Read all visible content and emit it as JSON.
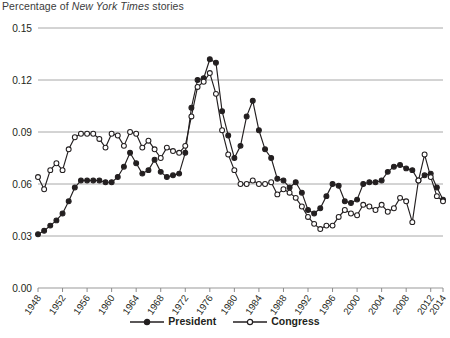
{
  "chart_data": {
    "type": "line",
    "title": "Percentage of New York Times stories",
    "title_parts": {
      "pre": "Percentage of ",
      "italic": "New York Times",
      "post": " stories"
    },
    "xlabel": "",
    "ylabel": "",
    "ylim": [
      0.0,
      0.15
    ],
    "xlim": [
      1948,
      2014
    ],
    "yticks": [
      "0.00",
      "0.03",
      "0.06",
      "0.09",
      "0.12",
      "0.15"
    ],
    "ytick_values": [
      0.0,
      0.03,
      0.06,
      0.09,
      0.12,
      0.15
    ],
    "xticks": [
      "1948",
      "1952",
      "1956",
      "1960",
      "1964",
      "1968",
      "1972",
      "1976",
      "1980",
      "1984",
      "1988",
      "1992",
      "1996",
      "2000",
      "2004",
      "2008",
      "2012",
      "2014"
    ],
    "xtick_values": [
      1948,
      1952,
      1956,
      1960,
      1964,
      1968,
      1972,
      1976,
      1980,
      1984,
      1988,
      1992,
      1996,
      2000,
      2004,
      2008,
      2012,
      2014
    ],
    "grid": "horizontal",
    "legend_position": "bottom-center",
    "x": [
      1948,
      1949,
      1950,
      1951,
      1952,
      1953,
      1954,
      1955,
      1956,
      1957,
      1958,
      1959,
      1960,
      1961,
      1962,
      1963,
      1964,
      1965,
      1966,
      1967,
      1968,
      1969,
      1970,
      1971,
      1972,
      1973,
      1974,
      1975,
      1976,
      1977,
      1978,
      1979,
      1980,
      1981,
      1982,
      1983,
      1984,
      1985,
      1986,
      1987,
      1988,
      1989,
      1990,
      1991,
      1992,
      1993,
      1994,
      1995,
      1996,
      1997,
      1998,
      1999,
      2000,
      2001,
      2002,
      2003,
      2004,
      2005,
      2006,
      2007,
      2008,
      2009,
      2010,
      2011,
      2012,
      2013,
      2014
    ],
    "series": [
      {
        "name": "President",
        "marker": "filled-circle",
        "color": "#231f20",
        "values": [
          0.031,
          0.033,
          0.036,
          0.039,
          0.043,
          0.05,
          0.058,
          0.062,
          0.062,
          0.062,
          0.062,
          0.061,
          0.061,
          0.064,
          0.07,
          0.078,
          0.072,
          0.066,
          0.068,
          0.074,
          0.067,
          0.064,
          0.065,
          0.066,
          0.078,
          0.104,
          0.12,
          0.121,
          0.132,
          0.13,
          0.102,
          0.088,
          0.075,
          0.082,
          0.099,
          0.108,
          0.091,
          0.08,
          0.075,
          0.063,
          0.062,
          0.058,
          0.061,
          0.055,
          0.045,
          0.043,
          0.046,
          0.053,
          0.06,
          0.059,
          0.05,
          0.049,
          0.051,
          0.06,
          0.061,
          0.061,
          0.062,
          0.067,
          0.07,
          0.071,
          0.069,
          0.068,
          0.062,
          0.065,
          0.066,
          0.058,
          0.051
        ]
      },
      {
        "name": "Congress",
        "marker": "open-circle",
        "color": "#231f20",
        "values": [
          0.064,
          0.057,
          0.068,
          0.072,
          0.068,
          0.08,
          0.087,
          0.089,
          0.089,
          0.089,
          0.086,
          0.081,
          0.089,
          0.088,
          0.082,
          0.09,
          0.089,
          0.081,
          0.085,
          0.08,
          0.075,
          0.081,
          0.079,
          0.078,
          0.082,
          0.099,
          0.116,
          0.119,
          0.124,
          0.112,
          0.091,
          0.077,
          0.068,
          0.06,
          0.06,
          0.062,
          0.06,
          0.06,
          0.061,
          0.054,
          0.057,
          0.055,
          0.052,
          0.047,
          0.041,
          0.037,
          0.034,
          0.036,
          0.036,
          0.041,
          0.045,
          0.043,
          0.042,
          0.048,
          0.047,
          0.045,
          0.048,
          0.044,
          0.046,
          0.052,
          0.05,
          0.038,
          0.062,
          0.077,
          0.064,
          0.053,
          0.05
        ]
      }
    ]
  }
}
